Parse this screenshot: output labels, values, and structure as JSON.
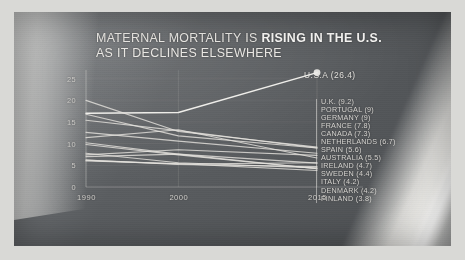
{
  "title": {
    "lead": "MATERNAL MORTALITY IS ",
    "bold": "RISING IN THE U.S.",
    "tail": " AS IT DECLINES ELSEWHERE",
    "full": "MATERNAL MORTALITY IS RISING IN THE U.S. AS IT DECLINES ELSEWHERE"
  },
  "annotation": {
    "usa": "U.S.A (26.4)"
  },
  "colors": {
    "panel": "#5a5d60",
    "line": "#e6e4df",
    "text": "#eceae6",
    "axis": "#cfcdc9",
    "border": "#d9d9d6"
  },
  "chart_data": {
    "type": "line",
    "title": "MATERNAL MORTALITY IS RISING IN THE U.S. AS IT DECLINES ELSEWHERE",
    "xlabel": "",
    "ylabel": "",
    "x": [
      1990,
      2000,
      2015
    ],
    "xticks": [
      "1990",
      "2000",
      "2015"
    ],
    "yticks": [
      "0",
      "5",
      "10",
      "15",
      "20",
      "25"
    ],
    "ylim": [
      0,
      27
    ],
    "grid": true,
    "legend_position": "right",
    "series": [
      {
        "name": "U.S.A",
        "label": "U.S.A (26.4)",
        "values": [
          17.0,
          17.2,
          26.4
        ],
        "end_value": 26.4,
        "highlight": true,
        "marker": true
      },
      {
        "name": "U.K.",
        "label": "U.K. (9.2)",
        "values": [
          20.0,
          12.8,
          9.2
        ],
        "end_value": 9.2,
        "highlight": false,
        "marker": false
      },
      {
        "name": "PORTUGAL",
        "label": "PORTUGAL (9)",
        "values": [
          16.8,
          11.8,
          9.0
        ],
        "end_value": 9.0,
        "highlight": false,
        "marker": false
      },
      {
        "name": "GERMANY",
        "label": "GERMANY (9)",
        "values": [
          15.4,
          13.0,
          9.0
        ],
        "end_value": 9.0,
        "highlight": false,
        "marker": false
      },
      {
        "name": "FRANCE",
        "label": "FRANCE (7.8)",
        "values": [
          12.6,
          10.6,
          7.8
        ],
        "end_value": 7.8,
        "highlight": false,
        "marker": false
      },
      {
        "name": "CANADA",
        "label": "CANADA (7.3)",
        "values": [
          7.4,
          8.6,
          7.3
        ],
        "end_value": 7.3,
        "highlight": false,
        "marker": false
      },
      {
        "name": "NETHERLANDS",
        "label": "NETHERLANDS (6.7)",
        "values": [
          11.4,
          13.2,
          6.7
        ],
        "end_value": 6.7,
        "highlight": false,
        "marker": false
      },
      {
        "name": "SPAIN",
        "label": "SPAIN (5.6)",
        "values": [
          6.2,
          5.3,
          5.6
        ],
        "end_value": 5.6,
        "highlight": false,
        "marker": false
      },
      {
        "name": "AUSTRALIA",
        "label": "AUSTRALIA (5.5)",
        "values": [
          7.0,
          7.6,
          5.5
        ],
        "end_value": 5.5,
        "highlight": false,
        "marker": false
      },
      {
        "name": "IRELAND",
        "label": "IRELAND (4.7)",
        "values": [
          6.2,
          5.2,
          4.7
        ],
        "end_value": 4.7,
        "highlight": false,
        "marker": false
      },
      {
        "name": "SWEDEN",
        "label": "SWEDEN (4.4)",
        "values": [
          7.8,
          5.6,
          4.4
        ],
        "end_value": 4.4,
        "highlight": false,
        "marker": false
      },
      {
        "name": "ITALY",
        "label": "ITALY (4.2)",
        "values": [
          10.2,
          7.6,
          4.2
        ],
        "end_value": 4.2,
        "highlight": false,
        "marker": false
      },
      {
        "name": "DENMARK",
        "label": "DENMARK (4.2)",
        "values": [
          9.8,
          7.4,
          4.2
        ],
        "end_value": 4.2,
        "highlight": false,
        "marker": false
      },
      {
        "name": "FINLAND",
        "label": "FINLAND (3.8)",
        "values": [
          6.0,
          5.4,
          3.8
        ],
        "end_value": 3.8,
        "highlight": false,
        "marker": false
      }
    ]
  }
}
